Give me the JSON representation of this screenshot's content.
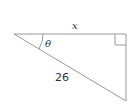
{
  "diagram": {
    "type": "right-triangle",
    "labels": {
      "adjacent": "x",
      "angle": "θ",
      "hypotenuse": "26"
    },
    "right_angle_marker": true,
    "colors": {
      "stroke": "#9a9a9a",
      "text": "#333333"
    }
  }
}
